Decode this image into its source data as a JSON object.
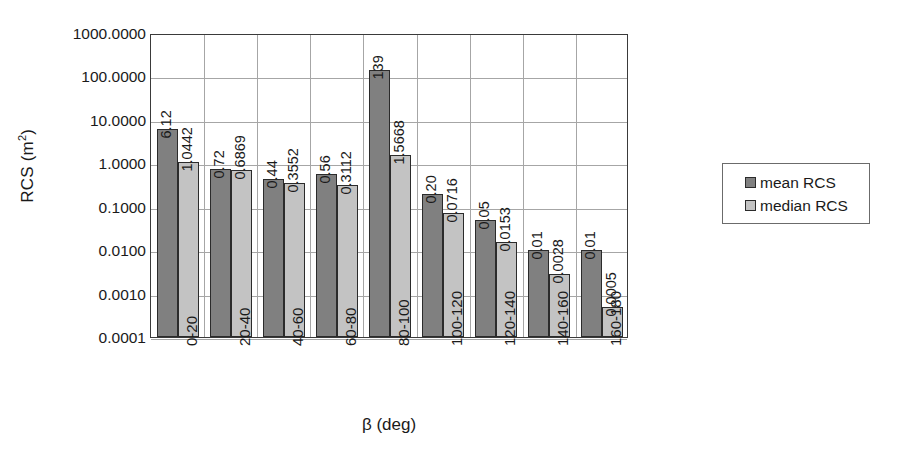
{
  "chart_data": {
    "type": "bar",
    "title": "",
    "subtitle": "",
    "xlabel": "β (deg)",
    "ylabel": "RCS (m²)",
    "ylabel_base": "RCS (m",
    "ylabel_sup": "2",
    "ylabel_close": ")",
    "yscale": "log",
    "ylim": [
      0.0001,
      1000.0
    ],
    "grid": "both",
    "legend_position": "right",
    "categories": [
      "0-20",
      "20-40",
      "40-60",
      "60-80",
      "80-100",
      "100-120",
      "120-140",
      "140-160",
      "160-180"
    ],
    "y_ticks": [
      1000.0,
      100.0,
      10.0,
      1.0,
      0.1,
      0.01,
      0.001,
      0.0001
    ],
    "y_tick_labels": [
      "1000.0000",
      "100.0000",
      "10.0000",
      "1.0000",
      "0.1000",
      "0.0100",
      "0.0010",
      "0.0001"
    ],
    "series": [
      {
        "name": "mean RCS",
        "color": "#808080",
        "values": [
          6.12,
          0.72,
          0.44,
          0.56,
          139,
          0.2,
          0.05,
          0.01,
          0.01
        ],
        "labels": [
          "6.12",
          "0.72",
          "0.44",
          "0.56",
          "139",
          "0.20",
          "0.05",
          "0.01",
          "0.01"
        ]
      },
      {
        "name": "median RCS",
        "color": "#c3c3c3",
        "values": [
          1.0442,
          0.6869,
          0.3552,
          0.3112,
          1.5668,
          0.0716,
          0.0153,
          0.0028,
          0.0005
        ],
        "labels": [
          "1.0442",
          "0.6869",
          "0.3552",
          "0.3112",
          "1.5668",
          "0.0716",
          "0.0153",
          "0.0028",
          "0.0005"
        ]
      }
    ]
  },
  "legend": {
    "items": [
      {
        "label": "mean RCS",
        "key": "mean"
      },
      {
        "label": "median RCS",
        "key": "median"
      }
    ]
  },
  "colors": {
    "mean": "#808080",
    "median": "#c3c3c3",
    "grid": "#a6a6a6",
    "axis": "#3a3a3a",
    "text": "#1a1a1a"
  }
}
